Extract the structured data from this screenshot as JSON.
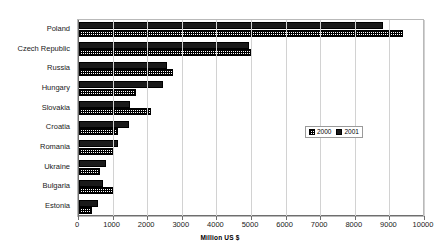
{
  "chart_data": {
    "type": "bar",
    "orientation": "horizontal",
    "title": "",
    "xlabel": "Million US $",
    "ylabel": "",
    "xlim": [
      0,
      10000
    ],
    "xticks": [
      0,
      1000,
      2000,
      3000,
      4000,
      5000,
      6000,
      7000,
      8000,
      9000,
      10000
    ],
    "xtick_labels": [
      "0",
      "1000",
      "2000",
      "3000",
      "4000",
      "5000",
      "6000",
      "7000",
      "8000",
      "9000",
      "10000"
    ],
    "grid": true,
    "grid_axis": "x",
    "legend_position": "center-right",
    "categories": [
      "Poland",
      "Czech Republic",
      "Russia",
      "Hungary",
      "Slovakia",
      "Croatia",
      "Romania",
      "Ukraine",
      "Bulgaria",
      "Estonia"
    ],
    "series": [
      {
        "name": "2000",
        "pattern": "checkered",
        "color": "#ffffff",
        "values": [
          9350,
          5000,
          2720,
          1640,
          2090,
          1130,
          1020,
          600,
          1000,
          390
        ]
      },
      {
        "name": "2001",
        "pattern": "solid",
        "color": "#1a1a1a",
        "values": [
          8800,
          4900,
          2550,
          2430,
          1480,
          1440,
          1130,
          780,
          700,
          540
        ]
      }
    ]
  },
  "legend": {
    "items": [
      {
        "label": "2000"
      },
      {
        "label": "2001"
      }
    ]
  },
  "axis": {
    "xlabel": "Million US $"
  },
  "top_strip": {
    "text": ""
  }
}
